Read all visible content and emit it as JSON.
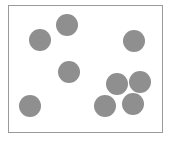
{
  "diagram": {
    "frame": {
      "x": 8,
      "y": 5,
      "width": 155,
      "height": 128,
      "border_color": "#9a9a9a"
    },
    "circle_color": "#8f8f8f",
    "circles": [
      {
        "cx": 67,
        "cy": 25,
        "r": 11
      },
      {
        "cx": 40,
        "cy": 40,
        "r": 11
      },
      {
        "cx": 134,
        "cy": 41,
        "r": 11
      },
      {
        "cx": 69,
        "cy": 72,
        "r": 11
      },
      {
        "cx": 117,
        "cy": 84,
        "r": 11
      },
      {
        "cx": 140,
        "cy": 82,
        "r": 11
      },
      {
        "cx": 30,
        "cy": 106,
        "r": 11
      },
      {
        "cx": 105,
        "cy": 106,
        "r": 11
      },
      {
        "cx": 133,
        "cy": 104,
        "r": 11
      }
    ]
  }
}
